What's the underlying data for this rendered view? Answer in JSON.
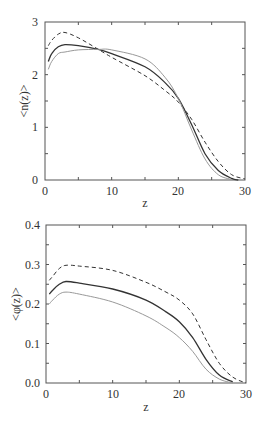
{
  "chart_data": [
    {
      "type": "line",
      "title": "",
      "xlabel": "z",
      "ylabel": "<n(z)>",
      "xlim": [
        0,
        30
      ],
      "ylim": [
        0,
        3
      ],
      "xticks": [
        "0",
        "10",
        "20",
        "30"
      ],
      "yticks": [
        "0",
        "1",
        "2",
        "3"
      ],
      "grid": false,
      "legend": null,
      "series": [
        {
          "name": "dashed",
          "style": "dashed",
          "color": "#333333",
          "x": [
            0.5,
            1,
            2,
            3,
            5,
            8,
            10,
            15,
            18,
            20,
            22,
            24,
            26,
            28,
            30
          ],
          "y": [
            2.55,
            2.65,
            2.77,
            2.8,
            2.7,
            2.48,
            2.33,
            1.98,
            1.7,
            1.48,
            1.15,
            0.72,
            0.35,
            0.1,
            0.02
          ]
        },
        {
          "name": "solid",
          "style": "solid",
          "color": "#333333",
          "x": [
            0.5,
            1,
            2,
            3,
            5,
            8,
            10,
            15,
            18,
            20,
            22,
            24,
            26,
            28,
            29
          ],
          "y": [
            2.25,
            2.4,
            2.53,
            2.57,
            2.55,
            2.48,
            2.4,
            2.15,
            1.85,
            1.55,
            1.05,
            0.5,
            0.18,
            0.03,
            0.0
          ]
        },
        {
          "name": "dotted",
          "style": "solid-light",
          "color": "#999999",
          "x": [
            0.5,
            1,
            2,
            3,
            5,
            8,
            10,
            15,
            18,
            20,
            22,
            24,
            26,
            28
          ],
          "y": [
            2.1,
            2.25,
            2.4,
            2.43,
            2.47,
            2.48,
            2.47,
            2.3,
            1.95,
            1.55,
            0.95,
            0.4,
            0.1,
            0.01
          ]
        }
      ]
    },
    {
      "type": "line",
      "title": "",
      "xlabel": "z",
      "ylabel": "<φ(z)>",
      "xlim": [
        0,
        30
      ],
      "ylim": [
        0,
        0.4
      ],
      "xticks": [
        "0",
        "10",
        "20",
        "30"
      ],
      "yticks": [
        "0.0",
        "0.1",
        "0.2",
        "0.3",
        "0.4"
      ],
      "grid": false,
      "legend": null,
      "series": [
        {
          "name": "dashed",
          "style": "dashed",
          "color": "#333333",
          "x": [
            0.5,
            1,
            2,
            3,
            5,
            10,
            15,
            18,
            20,
            22,
            24,
            26,
            28,
            30
          ],
          "y": [
            0.26,
            0.27,
            0.29,
            0.298,
            0.296,
            0.285,
            0.255,
            0.23,
            0.21,
            0.175,
            0.11,
            0.05,
            0.015,
            0.0
          ]
        },
        {
          "name": "solid",
          "style": "solid",
          "color": "#333333",
          "x": [
            0.5,
            1,
            2,
            3,
            5,
            10,
            15,
            18,
            20,
            22,
            24,
            26,
            28
          ],
          "y": [
            0.225,
            0.235,
            0.25,
            0.257,
            0.253,
            0.238,
            0.21,
            0.18,
            0.155,
            0.115,
            0.06,
            0.02,
            0.003
          ]
        },
        {
          "name": "dotted",
          "style": "solid-light",
          "color": "#999999",
          "x": [
            0.5,
            1,
            2,
            3,
            5,
            10,
            15,
            18,
            20,
            22,
            24,
            26,
            28
          ],
          "y": [
            0.2,
            0.21,
            0.225,
            0.23,
            0.225,
            0.205,
            0.17,
            0.14,
            0.115,
            0.08,
            0.035,
            0.01,
            0.0
          ]
        }
      ]
    }
  ],
  "plots": [
    {
      "ylabel": "<n(z)>",
      "xlabel": "z",
      "yticks": [
        "0",
        "1",
        "2",
        "3"
      ],
      "xticks": [
        "0",
        "10",
        "20",
        "30"
      ]
    },
    {
      "ylabel": "<φ(z)>",
      "xlabel": "z",
      "yticks": [
        "0.0",
        "0.1",
        "0.2",
        "0.3",
        "0.4"
      ],
      "xticks": [
        "0",
        "10",
        "20",
        "30"
      ]
    }
  ]
}
